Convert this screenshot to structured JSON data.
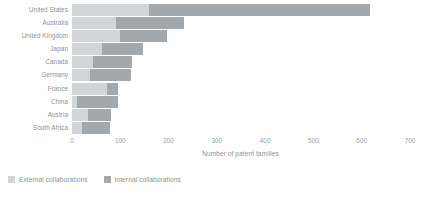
{
  "chart_data": {
    "type": "bar",
    "orientation": "horizontal",
    "stacked": true,
    "title": "",
    "xlabel": "Number of patent families",
    "ylabel": "",
    "xlim": [
      0,
      700
    ],
    "xticks": [
      0,
      100,
      200,
      300,
      400,
      500,
      600,
      700
    ],
    "xtick_labels": [
      "0",
      "100",
      "200",
      "300",
      "400",
      "500",
      "600",
      "700"
    ],
    "grid": false,
    "legend_position": "bottom-left",
    "categories": [
      "United States",
      "Australia",
      "United Kingdom",
      "Japan",
      "Canada",
      "Germany",
      "France",
      "China",
      "Austria",
      "South Africa"
    ],
    "series": [
      {
        "name": "External collaborations",
        "color": "#d2d5d8",
        "values": [
          160,
          92,
          100,
          63,
          43,
          37,
          72,
          10,
          33,
          20
        ]
      },
      {
        "name": "Internal collaborations",
        "color": "#a3a8ad",
        "values": [
          458,
          140,
          96,
          85,
          81,
          85,
          23,
          85,
          48,
          58
        ]
      }
    ],
    "totals": [
      618,
      232,
      196,
      148,
      124,
      122,
      95,
      95,
      81,
      78
    ]
  },
  "axis": {
    "title": "Number of patent families"
  },
  "legend": {
    "items": [
      {
        "label": "External collaborations",
        "color": "#d2d5d8",
        "swatch_name": "legend-swatch-external"
      },
      {
        "label": "Internal collaborations",
        "color": "#a3a8ad",
        "swatch_name": "legend-swatch-internal"
      }
    ]
  }
}
